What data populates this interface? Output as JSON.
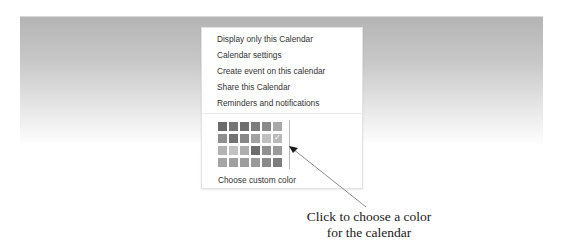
{
  "menu": {
    "items": [
      {
        "label": "Display only this Calendar"
      },
      {
        "label": "Calendar settings"
      },
      {
        "label": "Create event on this calendar"
      },
      {
        "label": "Share this Calendar"
      },
      {
        "label": "Reminders and notifications"
      }
    ],
    "color_palette": {
      "rows": [
        [
          "#6b6b6b",
          "#747474",
          "#6f6f6f",
          "#7c7c7c",
          "#8a8a8a",
          "#a9a9a9"
        ],
        [
          "#8e8e8e",
          "#727272",
          "#888888",
          "#a2a2a2",
          "#c1c1c1",
          "#b9b9b9"
        ],
        [
          "#b3b3b3",
          "#c2c2c2",
          "#aeaeae",
          "#6d6d6d",
          "#909090",
          "#9a9a9a"
        ],
        [
          "#a5a5a5",
          "#a0a0a0",
          "#9d9d9d",
          "#9a9a9a",
          "#8b8b8b",
          "#7d7d7d"
        ]
      ],
      "selected": {
        "row": 1,
        "col": 5
      },
      "check_icon": "✓"
    },
    "custom_color_label": "Choose custom color"
  },
  "annotation": {
    "caption_line1": "Click to choose a color",
    "caption_line2": "for the calendar",
    "arrow_color": "#8c8c8c"
  }
}
